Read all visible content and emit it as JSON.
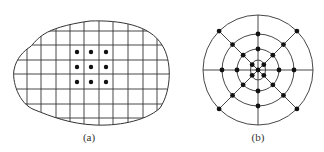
{
  "figures": [
    {
      "id": "a",
      "caption": "(a)",
      "description": "Irregular region overlaid with a rectangular grid; 3x3 array of dots at the center",
      "grid": {
        "vertical_lines_x": [
          27,
          41,
          56,
          70,
          84,
          99,
          113,
          128,
          143,
          157
        ],
        "horizontal_lines_y": [
          31,
          45,
          60,
          74,
          89,
          104,
          118
        ]
      },
      "dots": [
        [
          77,
          52
        ],
        [
          91,
          52
        ],
        [
          106,
          52
        ],
        [
          77,
          67
        ],
        [
          91,
          67
        ],
        [
          106,
          67
        ],
        [
          77,
          82
        ],
        [
          91,
          82
        ],
        [
          106,
          82
        ]
      ]
    },
    {
      "id": "b",
      "caption": "(b)",
      "description": "Polar grid: concentric circles with 8 radial spokes, nodes at intersections",
      "center": [
        258,
        70
      ],
      "rings_radius": [
        10,
        21,
        36,
        55
      ],
      "spokes_deg": [
        0,
        45,
        90,
        135,
        180,
        225,
        270,
        315
      ]
    }
  ],
  "colors": {
    "line": "#333333",
    "dot": "#111111",
    "background": "#ffffff"
  }
}
